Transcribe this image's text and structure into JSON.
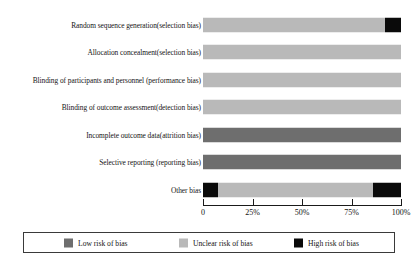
{
  "chart_data": {
    "type": "bar",
    "subtype": "stacked-horizontal-percent",
    "title": "",
    "xlabel": "",
    "ylabel": "",
    "xlim": [
      0,
      100
    ],
    "grid": false,
    "legend_position": "bottom",
    "categories": [
      "Random sequence generation(selection bias)",
      "Allocation concealment(selection bias)",
      "Blinding of participants and personnel (performance bias)",
      "Blinding of outcome assessment(detection bias)",
      "Incomplete outcome data(attrition bias)",
      "Selective reporting (reporting bias)",
      "Other bias"
    ],
    "series": [
      {
        "name": "Low risk of bias",
        "color": "#6e6e6e",
        "values": [
          0,
          0,
          0,
          0,
          100,
          100,
          0
        ]
      },
      {
        "name": "Unclear risk of bias",
        "color": "#b9b9b9",
        "values": [
          92,
          100,
          100,
          100,
          0,
          0,
          78
        ]
      },
      {
        "name": "High risk of bias",
        "color": "#0a0a0a",
        "values": [
          8,
          0,
          0,
          0,
          0,
          0,
          22
        ]
      }
    ],
    "stacks": [
      [
        {
          "series": "Unclear risk of bias",
          "value": 92
        },
        {
          "series": "High risk of bias",
          "value": 8
        }
      ],
      [
        {
          "series": "Unclear risk of bias",
          "value": 100
        }
      ],
      [
        {
          "series": "Unclear risk of bias",
          "value": 100
        }
      ],
      [
        {
          "series": "Unclear risk of bias",
          "value": 100
        }
      ],
      [
        {
          "series": "Low risk of bias",
          "value": 100
        }
      ],
      [
        {
          "series": "Low risk of bias",
          "value": 100
        }
      ],
      [
        {
          "series": "High risk of bias",
          "value": 7.5
        },
        {
          "series": "Unclear risk of bias",
          "value": 78.5
        },
        {
          "series": "High risk of bias",
          "value": 14
        }
      ]
    ],
    "xticks": [
      {
        "value": 0,
        "label": "0"
      },
      {
        "value": 25,
        "label": "25%"
      },
      {
        "value": 50,
        "label": "50%"
      },
      {
        "value": 75,
        "label": "75%"
      },
      {
        "value": 100,
        "label": "100%"
      }
    ]
  },
  "legend": {
    "items": [
      {
        "label": "Low risk of bias",
        "color": "#6e6e6e"
      },
      {
        "label": "Unclear risk of bias",
        "color": "#b9b9b9"
      },
      {
        "label": "High risk of bias",
        "color": "#0a0a0a"
      }
    ]
  },
  "caption": {
    "text": ""
  },
  "colors": {
    "low_risk": "#6e6e6e",
    "unclear_risk": "#b9b9b9",
    "high_risk": "#0a0a0a",
    "axis": "#1a1a1a",
    "background": "#ffffff"
  }
}
